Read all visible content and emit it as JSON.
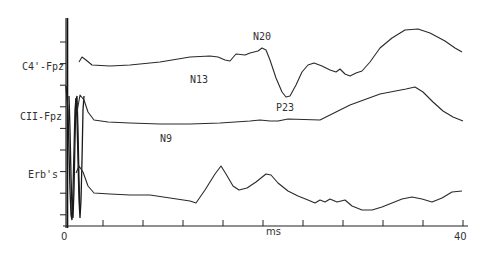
{
  "chart_data": {
    "type": "line",
    "title": "",
    "xlabel": "ms",
    "ylabel": "",
    "xlim": [
      0,
      40
    ],
    "x_tick_step": 4,
    "x_tick_labels": [
      {
        "value": 0,
        "label": "0"
      },
      {
        "value": 40,
        "label": "40"
      }
    ],
    "y_tick_count": 9,
    "grid": false,
    "amplitude_units": "arbitrary (upward = negative polarity)",
    "series": [
      {
        "name": "C4'-Fpz",
        "label": "C4'-Fpz",
        "points": [
          [
            1.6,
            0.4
          ],
          [
            1.9,
            0.9
          ],
          [
            2.3,
            0.6
          ],
          [
            2.9,
            0.1
          ],
          [
            4.7,
            0.0
          ],
          [
            6.7,
            0.1
          ],
          [
            9.7,
            0.4
          ],
          [
            12.7,
            0.9
          ],
          [
            14.7,
            1.0
          ],
          [
            15.5,
            0.9
          ],
          [
            16.2,
            0.6
          ],
          [
            16.7,
            0.5
          ],
          [
            17.3,
            1.2
          ],
          [
            18.2,
            1.1
          ],
          [
            18.7,
            1.3
          ],
          [
            19.5,
            1.5
          ],
          [
            19.9,
            1.8
          ],
          [
            20.3,
            1.6
          ],
          [
            20.7,
            0.6
          ],
          [
            21.3,
            -1.2
          ],
          [
            21.9,
            -2.6
          ],
          [
            22.3,
            -3.1
          ],
          [
            22.7,
            -3.0
          ],
          [
            23.3,
            -1.9
          ],
          [
            23.9,
            -0.6
          ],
          [
            24.5,
            0.1
          ],
          [
            25.1,
            0.3
          ],
          [
            25.9,
            0.0
          ],
          [
            26.7,
            -0.4
          ],
          [
            27.3,
            -0.6
          ],
          [
            27.7,
            -0.3
          ],
          [
            28.2,
            -0.8
          ],
          [
            28.7,
            -1.0
          ],
          [
            29.3,
            -0.7
          ],
          [
            29.9,
            -0.5
          ],
          [
            30.7,
            0.4
          ],
          [
            31.7,
            1.8
          ],
          [
            32.9,
            2.8
          ],
          [
            34.2,
            3.6
          ],
          [
            35.5,
            3.7
          ],
          [
            36.7,
            3.3
          ],
          [
            38.2,
            2.5
          ],
          [
            39.2,
            1.8
          ],
          [
            39.9,
            1.4
          ]
        ],
        "peaks": [
          {
            "name": "N20",
            "ms": 19.9
          },
          {
            "name": "P23",
            "ms": 22.4
          }
        ]
      },
      {
        "name": "CII-Fpz",
        "label": "CII-Fpz",
        "points": [
          [
            1.4,
            0.6
          ],
          [
            1.7,
            2.3
          ],
          [
            2.1,
            1.8
          ],
          [
            2.5,
            0.6
          ],
          [
            3.1,
            -0.2
          ],
          [
            4.5,
            -0.4
          ],
          [
            6.7,
            -0.5
          ],
          [
            9.7,
            -0.6
          ],
          [
            12.7,
            -0.6
          ],
          [
            15.7,
            -0.5
          ],
          [
            18.7,
            -0.3
          ],
          [
            19.7,
            -0.2
          ],
          [
            20.7,
            -0.3
          ],
          [
            21.5,
            -0.3
          ],
          [
            22.5,
            -0.1
          ],
          [
            25.7,
            -0.2
          ],
          [
            27.3,
            0.6
          ],
          [
            28.7,
            1.3
          ],
          [
            31.7,
            2.4
          ],
          [
            34.3,
            2.9
          ],
          [
            35.2,
            3.1
          ],
          [
            36.0,
            2.6
          ],
          [
            37.0,
            1.6
          ],
          [
            38.0,
            0.7
          ],
          [
            39.0,
            0.1
          ],
          [
            40.0,
            -0.3
          ]
        ],
        "peaks": [
          {
            "name": "N13",
            "ms": 13.6
          }
        ]
      },
      {
        "name": "Erb's",
        "label": "Erb's",
        "points": [
          [
            1.3,
            0.7
          ],
          [
            1.6,
            1.4
          ],
          [
            2.0,
            0.8
          ],
          [
            2.5,
            -0.6
          ],
          [
            3.1,
            -1.3
          ],
          [
            4.7,
            -1.4
          ],
          [
            6.7,
            -1.5
          ],
          [
            8.7,
            -1.5
          ],
          [
            10.7,
            -1.8
          ],
          [
            12.7,
            -2.1
          ],
          [
            13.3,
            -2.3
          ],
          [
            14.2,
            -1.0
          ],
          [
            15.2,
            0.6
          ],
          [
            15.8,
            1.4
          ],
          [
            16.3,
            0.6
          ],
          [
            17.0,
            -0.6
          ],
          [
            17.6,
            -1.0
          ],
          [
            18.4,
            -0.8
          ],
          [
            19.3,
            -0.2
          ],
          [
            20.3,
            0.6
          ],
          [
            20.8,
            0.5
          ],
          [
            21.5,
            -0.3
          ],
          [
            22.5,
            -1.1
          ],
          [
            23.5,
            -1.6
          ],
          [
            24.5,
            -2.0
          ],
          [
            25.2,
            -2.3
          ],
          [
            25.7,
            -2.0
          ],
          [
            26.2,
            -2.2
          ],
          [
            26.7,
            -1.9
          ],
          [
            27.4,
            -2.2
          ],
          [
            28.2,
            -2.0
          ],
          [
            28.9,
            -2.6
          ],
          [
            29.9,
            -3.0
          ],
          [
            30.9,
            -3.0
          ],
          [
            31.9,
            -2.7
          ],
          [
            32.9,
            -2.3
          ],
          [
            33.9,
            -1.9
          ],
          [
            34.9,
            -1.7
          ],
          [
            35.9,
            -1.9
          ],
          [
            36.9,
            -2.2
          ],
          [
            37.9,
            -1.8
          ],
          [
            38.9,
            -1.2
          ],
          [
            39.9,
            -1.1
          ]
        ],
        "peaks": [
          {
            "name": "N9",
            "ms": 9.7
          }
        ]
      }
    ],
    "annotations": [
      {
        "text": "N20",
        "series": "C4'-Fpz",
        "ms": 19.9
      },
      {
        "text": "P23",
        "series": "C4'-Fpz",
        "ms": 22.4
      },
      {
        "text": "N13",
        "series": "CII-Fpz",
        "ms": 13.6
      },
      {
        "text": "N9",
        "series": "Erb's",
        "ms": 9.7
      }
    ]
  }
}
